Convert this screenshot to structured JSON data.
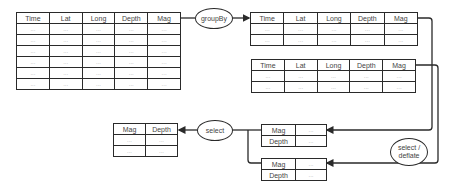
{
  "diagram": {
    "source_table": {
      "headers": [
        "Time",
        "Lat",
        "Long",
        "Depth",
        "Mag"
      ],
      "rows": [
        [
          "...",
          "...",
          "...",
          "...",
          "..."
        ],
        [
          "...",
          "...",
          "...",
          "...",
          "..."
        ],
        [
          "...",
          "...",
          "...",
          "...",
          "..."
        ],
        [
          "...",
          "...",
          "...",
          "...",
          "..."
        ],
        [
          "...",
          "...",
          "...",
          "...",
          "..."
        ],
        [
          "...",
          "...",
          "...",
          "...",
          "..."
        ]
      ]
    },
    "groupby_node": {
      "label": "groupBy"
    },
    "group_tables": [
      {
        "headers": [
          "Time",
          "Lat",
          "Long",
          "Depth",
          "Mag"
        ],
        "rows": [
          [
            "...",
            "...",
            "...",
            "...",
            "..."
          ],
          [
            "...",
            "...",
            "...",
            "...",
            "..."
          ]
        ]
      },
      {
        "headers": [
          "Time",
          "Lat",
          "Long",
          "Depth",
          "Mag"
        ],
        "rows": [
          [
            "...",
            "...",
            "...",
            "...",
            "..."
          ],
          [
            "...",
            "...",
            "...",
            "...",
            "..."
          ]
        ]
      }
    ],
    "deflate_node": {
      "label_line1": "select /",
      "label_line2": "deflate"
    },
    "deflated_tables": [
      {
        "rows": [
          [
            "Mag",
            "..."
          ],
          [
            "Depth",
            "..."
          ]
        ]
      },
      {
        "rows": [
          [
            "Mag",
            "..."
          ],
          [
            "Depth",
            "..."
          ]
        ]
      }
    ],
    "select_node": {
      "label": "select"
    },
    "result_table": {
      "headers": [
        "Mag",
        "Depth"
      ],
      "rows": [
        [
          "...",
          "..."
        ],
        [
          "...",
          "..."
        ]
      ]
    }
  }
}
